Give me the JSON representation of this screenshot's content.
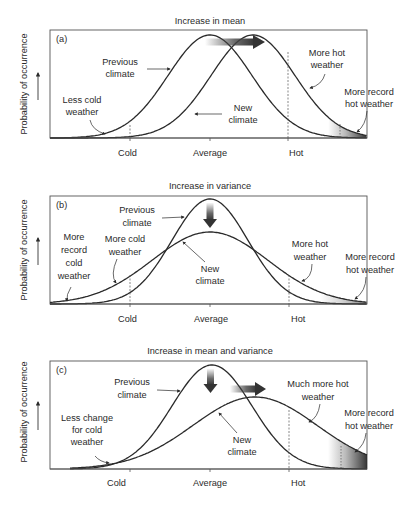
{
  "panels": [
    {
      "id": "a",
      "title": "Increase in mean",
      "tag": "(a)",
      "y_axis_label": "Probability of occurrence",
      "x_ticks": [
        "Cold",
        "Average",
        "Hot"
      ],
      "labels": {
        "previous": [
          "Previous",
          "climate"
        ],
        "new": [
          "New",
          "climate"
        ],
        "left": [
          "Less cold",
          "weather"
        ],
        "right_mid": [
          "More hot",
          "weather"
        ],
        "right_far": [
          "More record",
          "hot weather"
        ]
      },
      "arrow": "right"
    },
    {
      "id": "b",
      "title": "Increase in variance",
      "tag": "(b)",
      "y_axis_label": "Probability of occurrence",
      "x_ticks": [
        "Cold",
        "Average",
        "Hot"
      ],
      "labels": {
        "previous": [
          "Previous",
          "climate"
        ],
        "new": [
          "New",
          "climate"
        ],
        "left_far": [
          "More",
          "record",
          "cold",
          "weather"
        ],
        "left": [
          "More cold",
          "weather"
        ],
        "right_mid": [
          "More hot",
          "weather"
        ],
        "right_far": [
          "More record",
          "hot weather"
        ]
      },
      "arrow": "down"
    },
    {
      "id": "c",
      "title": "Increase in mean and variance",
      "tag": "(c)",
      "y_axis_label": "Probability of occurrence",
      "x_ticks": [
        "Cold",
        "Average",
        "Hot"
      ],
      "labels": {
        "previous": [
          "Previous",
          "climate"
        ],
        "new": [
          "New",
          "climate"
        ],
        "left": [
          "Less change",
          "for cold",
          "weather"
        ],
        "right_mid": [
          "Much more hot",
          "weather"
        ],
        "right_far": [
          "More record",
          "hot weather"
        ]
      },
      "arrow": "down-right"
    }
  ],
  "colors": {
    "line": "#2a2a2a",
    "frame": "#555555",
    "shade": "#3a3a3a",
    "background": "#ffffff"
  }
}
